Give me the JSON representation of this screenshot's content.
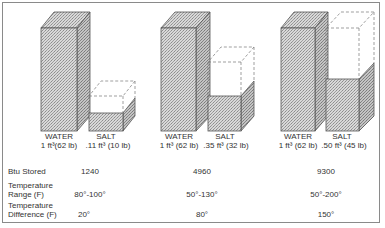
{
  "figure": {
    "groups": [
      {
        "water": {
          "name": "WATER",
          "amount": "1 ft³(62 lb)"
        },
        "salt": {
          "name": "SALT",
          "amount": ".11 ft³ (10 lb)"
        },
        "btu_stored": "1240",
        "temperature_range": "80°-100°",
        "temperature_difference": "20°"
      },
      {
        "water": {
          "name": "WATER",
          "amount": "1 ft³ (62 lb)"
        },
        "salt": {
          "name": "SALT",
          "amount": ".35 ft³ (32 lb)"
        },
        "btu_stored": "4960",
        "temperature_range": "50°-130°",
        "temperature_difference": "80°"
      },
      {
        "water": {
          "name": "WATER",
          "amount": "1 ft³ (62 lb)"
        },
        "salt": {
          "name": "SALT",
          "amount": ".50 ft³ (45 lb)"
        },
        "btu_stored": "9300",
        "temperature_range": "50°-200°",
        "temperature_difference": "150°"
      }
    ],
    "row_labels": {
      "btu_stored": "Btu Stored",
      "temperature_range_1": "Temperature",
      "temperature_range_2": "Range (F)",
      "temperature_difference_1": "Temperature",
      "temperature_difference_2": "Difference (F)"
    },
    "colors": {
      "fill": "#c8c8c8",
      "outline": "#555555",
      "dashed": "#777777",
      "border": "#8a8a8a"
    }
  }
}
